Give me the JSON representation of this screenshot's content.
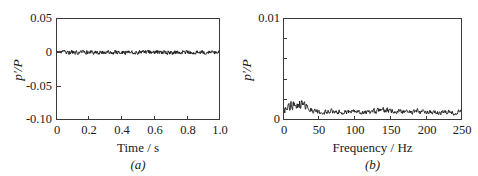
{
  "figure": {
    "background_color": "#ffffff",
    "line_color": "#1a1a1a",
    "axis_color": "#3a3a3a"
  },
  "panels": {
    "a": {
      "caption": "(a)",
      "y_axis_title": "p'/P",
      "x_axis_title": "Time / s",
      "y_ticks": [
        "0.05",
        "0",
        "-0.05",
        "-0.10"
      ],
      "x_ticks": [
        "0",
        "0.2",
        "0.4",
        "0.6",
        "0.8",
        "1.0"
      ]
    },
    "b": {
      "caption": "(b)",
      "y_axis_title": "p'/P",
      "x_axis_title": "Frequency / Hz",
      "y_ticks": [
        "0.01",
        "0"
      ],
      "x_ticks": [
        "0",
        "50",
        "100",
        "150",
        "200",
        "250"
      ]
    }
  },
  "chart_data": [
    {
      "type": "line",
      "panel": "a",
      "title": "",
      "xlabel": "Time / s",
      "ylabel": "p'/P",
      "xlim": [
        0,
        1.0
      ],
      "ylim": [
        -0.1,
        0.05
      ],
      "xticks": [
        0,
        0.2,
        0.4,
        0.6,
        0.8,
        1.0
      ],
      "yticks": [
        0.05,
        0,
        -0.05,
        -0.1
      ],
      "grid": false,
      "legend": "none",
      "description": "Broadband low-amplitude pressure fluctuation signal oscillating about zero with peak amplitude near +/-0.004.",
      "series": [
        {
          "name": "p'/P time trace",
          "mean": 0.0,
          "amplitude_rms": 0.0016,
          "amplitude_peak": 0.0045,
          "n_points": 500,
          "x": [
            0.0,
            0.002,
            0.004,
            0.006,
            0.008,
            0.01,
            0.012,
            0.014,
            0.016,
            0.018,
            0.02,
            0.022,
            0.024,
            0.026,
            0.028,
            0.03,
            0.032,
            0.034,
            0.036,
            0.038,
            0.04,
            0.042,
            0.044,
            0.046,
            0.048,
            0.05,
            0.052,
            0.054,
            0.056,
            0.058,
            0.06,
            0.062,
            0.064,
            0.066,
            0.068,
            0.07,
            0.072,
            0.074,
            0.076,
            0.078,
            0.08,
            0.082,
            0.084,
            0.086,
            0.088,
            0.09,
            0.092,
            0.094,
            0.096,
            0.098
          ],
          "y_sample": [
            0.0012,
            -0.0018,
            0.0021,
            -0.0009,
            0.0015,
            -0.0024,
            0.0008,
            0.0019,
            -0.0013,
            0.0026,
            -0.0021,
            0.0011,
            -0.0007,
            0.0023,
            -0.0016,
            0.0009,
            0.0018,
            -0.0025,
            0.0014,
            -0.0011,
            0.0022,
            -0.0019,
            0.0007,
            0.0016,
            -0.0023,
            0.0012,
            -0.0008,
            0.0025,
            -0.0017,
            0.001,
            0.002,
            -0.0014,
            0.0018,
            -0.0022,
            0.0009,
            0.0015,
            -0.0026,
            0.0013,
            -0.001,
            0.0021,
            -0.0018,
            0.0008,
            0.0024,
            -0.0015,
            0.0011,
            -0.0019,
            0.0017,
            0.0007,
            -0.0021,
            0.0014
          ]
        }
      ]
    },
    {
      "type": "line",
      "panel": "b",
      "title": "",
      "xlabel": "Frequency / Hz",
      "ylabel": "p'/P",
      "xlim": [
        0,
        250
      ],
      "ylim": [
        0,
        0.01
      ],
      "xticks": [
        0,
        50,
        100,
        150,
        200,
        250
      ],
      "yticks": [
        0,
        0.01
      ],
      "yticks_minor": [
        0.002,
        0.004,
        0.006,
        0.008
      ],
      "grid": false,
      "legend": "none",
      "description": "Amplitude spectrum of the time trace: a broad low-frequency hump peaking near 20-30 Hz at about 0.0016, decaying to a flat broadband floor near 0.0007 above 50 Hz.",
      "series": [
        {
          "name": "p'/P spectrum",
          "baseline": 0.0007,
          "peak_value": 0.0016,
          "peak_frequency": 25,
          "x": [
            0,
            5,
            10,
            15,
            20,
            25,
            30,
            35,
            40,
            45,
            50,
            60,
            70,
            80,
            90,
            100,
            110,
            120,
            130,
            140,
            150,
            160,
            170,
            180,
            190,
            200,
            210,
            220,
            230,
            240,
            250
          ],
          "y": [
            0.0009,
            0.0011,
            0.0013,
            0.0014,
            0.0016,
            0.0015,
            0.0014,
            0.0011,
            0.0009,
            0.0008,
            0.0007,
            0.0007,
            0.0008,
            0.0007,
            0.0007,
            0.0008,
            0.0007,
            0.0007,
            0.0008,
            0.0009,
            0.0008,
            0.0007,
            0.0008,
            0.0007,
            0.0008,
            0.0007,
            0.0007,
            0.0006,
            0.0007,
            0.0006,
            0.0007
          ]
        }
      ]
    }
  ]
}
